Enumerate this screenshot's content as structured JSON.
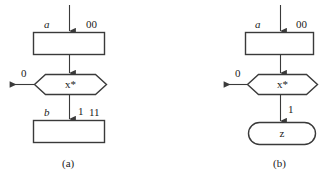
{
  "figure": {
    "background_color": "#ffffff",
    "stroke_color": "#3a3a3a",
    "text_color": "#1b1b1b"
  },
  "panels": [
    {
      "id": "a",
      "caption": "(a)",
      "nodes": [
        {
          "name": "state-box-top",
          "shape": "rectangle",
          "text": ""
        },
        {
          "name": "decision-hexagon",
          "shape": "hexagon",
          "text": "x*"
        },
        {
          "name": "state-box-bottom",
          "shape": "rectangle",
          "text": ""
        }
      ],
      "labels": {
        "top_left": "a",
        "top_right": "00",
        "branch_zero": "0",
        "bottom_left": "b",
        "branch_one": "1",
        "bottom_right": "11"
      }
    },
    {
      "id": "b",
      "caption": "(b)",
      "nodes": [
        {
          "name": "state-box-top",
          "shape": "rectangle",
          "text": ""
        },
        {
          "name": "decision-hexagon",
          "shape": "hexagon",
          "text": "x*"
        },
        {
          "name": "output-stadium",
          "shape": "stadium",
          "text": "z"
        }
      ],
      "labels": {
        "top_left": "a",
        "top_right": "00",
        "branch_zero": "0",
        "branch_one": "1"
      }
    }
  ]
}
